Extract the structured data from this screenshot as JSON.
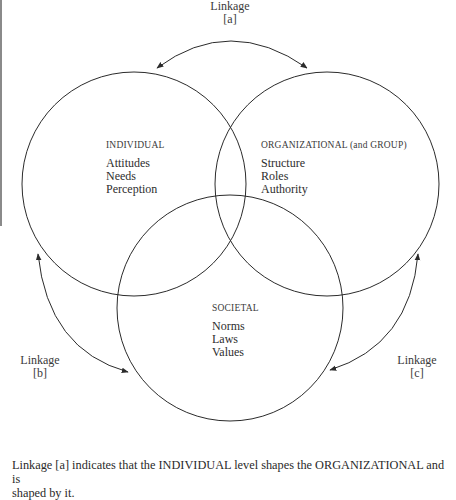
{
  "diagram": {
    "circles": {
      "individual": {
        "heading": "INDIVIDUAL",
        "items": [
          "Attitudes",
          "Needs",
          "Perception"
        ]
      },
      "organizational": {
        "heading": "ORGANIZATIONAL (and GROUP)",
        "items": [
          "Structure",
          "Roles",
          "Authority"
        ]
      },
      "societal": {
        "heading": "SOCIETAL",
        "items": [
          "Norms",
          "Laws",
          "Values"
        ]
      }
    },
    "linkages": {
      "a": {
        "label": "Linkage",
        "tag": "[a]"
      },
      "b": {
        "label": "Linkage",
        "tag": "[b]"
      },
      "c": {
        "label": "Linkage",
        "tag": "[c]"
      }
    },
    "stroke_color": "#2b2b2b"
  },
  "caption": {
    "line1": "Linkage [a] indicates that the INDIVIDUAL level shapes the ORGANIZATIONAL and is",
    "line2": "shaped by it."
  }
}
